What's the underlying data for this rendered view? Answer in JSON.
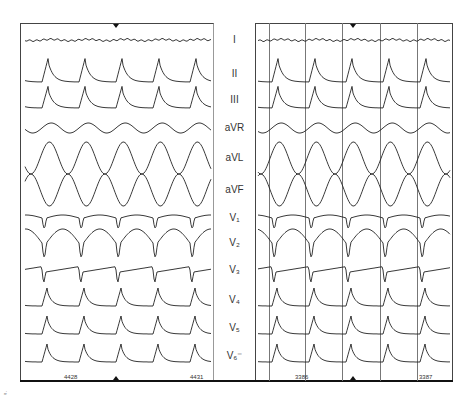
{
  "figure": {
    "title": "",
    "corner_mark": "ᵐⁱ",
    "leads": [
      {
        "name": "I",
        "label": "I",
        "y": 40
      },
      {
        "name": "II",
        "label": "II",
        "y": 74
      },
      {
        "name": "III",
        "label": "III",
        "y": 100
      },
      {
        "name": "aVR",
        "label": "aVR",
        "y": 128
      },
      {
        "name": "aVL",
        "label": "aVL",
        "y": 158
      },
      {
        "name": "aVF",
        "label": "aVF",
        "y": 190
      },
      {
        "name": "V1",
        "label": "V₁",
        "y": 218
      },
      {
        "name": "V2",
        "label": "V₂",
        "y": 243
      },
      {
        "name": "V3",
        "label": "V₃",
        "y": 270
      },
      {
        "name": "V4",
        "label": "V₄",
        "y": 300
      },
      {
        "name": "V5",
        "label": "V₅",
        "y": 328
      },
      {
        "name": "V6",
        "label": "V₆⁻",
        "y": 356
      }
    ],
    "left_panel": {
      "tick_labels": [
        {
          "text": "4428",
          "x": 72
        },
        {
          "text": "4431",
          "x": 198
        }
      ],
      "top_marker_x": 116,
      "bottom_marker_x": 116,
      "beat_x": [
        42,
        75,
        111,
        150,
        187
      ],
      "cycle_width": 37
    },
    "right_panel": {
      "tick_labels": [
        {
          "text": "3386",
          "x": 303
        },
        {
          "text": "3387",
          "x": 427
        }
      ],
      "top_marker_x": 353,
      "bottom_marker_x": 353,
      "beat_x": [
        272,
        308,
        345,
        383,
        418
      ],
      "cycle_width": 37,
      "vertical_markers_x": [
        269,
        305,
        342,
        380,
        417
      ]
    },
    "colors": {
      "trace": "#222222",
      "frame": "#444444",
      "label": "#333333",
      "background": "#ffffff"
    }
  }
}
